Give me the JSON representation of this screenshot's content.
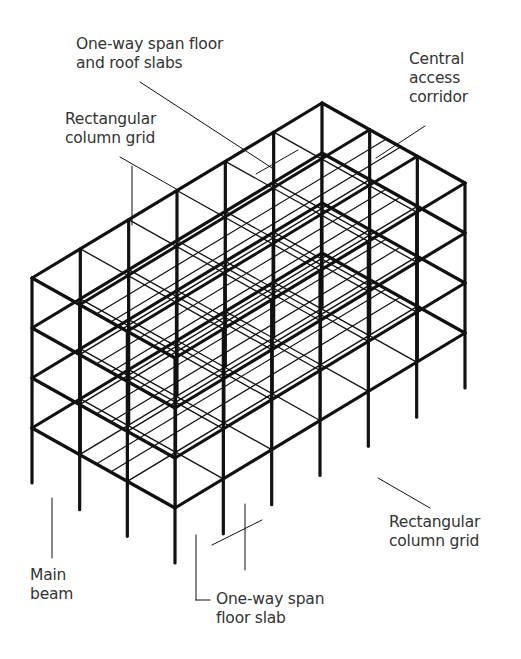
{
  "diagram": {
    "labels": {
      "roof_slabs": {
        "line1": "One-way span floor",
        "line2": "and roof slabs"
      },
      "corridor": {
        "line1": "Central",
        "line2": "access",
        "line3": "corridor"
      },
      "grid_top": {
        "line1": "Rectangular",
        "line2": "column grid"
      },
      "grid_right": {
        "line1": "Rectangular",
        "line2": "column grid"
      },
      "main_beam": {
        "line1": "Main",
        "line2": "beam"
      },
      "floor_slab": {
        "line1": "One-way span",
        "line2": "floor slab"
      }
    },
    "colors": {
      "line": "#111111",
      "text": "#333333",
      "background": "#ffffff"
    }
  }
}
